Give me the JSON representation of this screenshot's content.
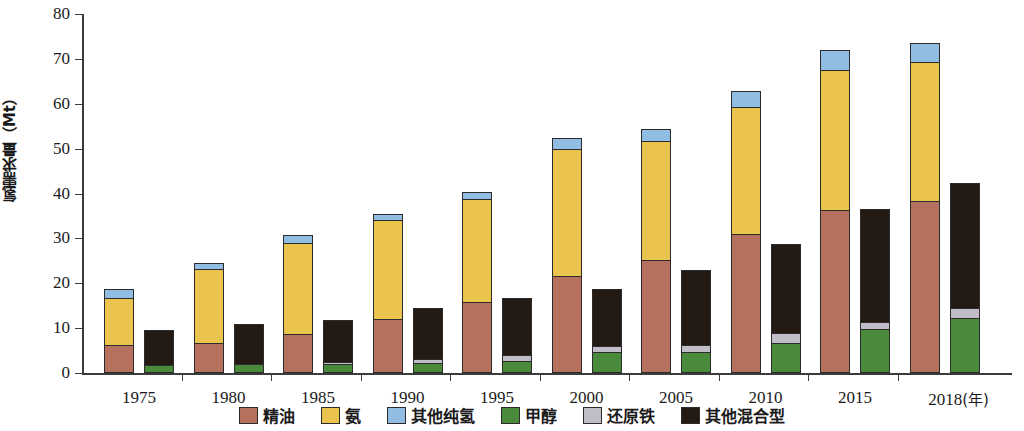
{
  "chart_data": {
    "type": "bar",
    "title": "",
    "xlabel": "年",
    "ylabel": "氢需求量（Mt）",
    "ylim": [
      0,
      80
    ],
    "yticks": [
      0,
      10,
      20,
      30,
      40,
      50,
      60,
      70,
      80
    ],
    "grid": false,
    "legend_position": "bottom",
    "stacked": true,
    "grouped_bars_per_category": 2,
    "categories": [
      "1975",
      "1980",
      "1985",
      "1990",
      "1995",
      "2000",
      "2005",
      "2010",
      "2015",
      "2018"
    ],
    "x_axis_unit_label": "(年)",
    "series": [
      {
        "name": "精油",
        "group": "纯氢",
        "color": "#b5705e",
        "values": [
          6.0,
          6.5,
          8.4,
          11.8,
          15.7,
          21.5,
          25.0,
          30.7,
          36.0,
          38.2
        ]
      },
      {
        "name": "氨",
        "group": "纯氢",
        "color": "#eac44c",
        "values": [
          10.6,
          16.4,
          20.4,
          22.0,
          22.8,
          28.3,
          26.5,
          28.3,
          31.2,
          30.8
        ]
      },
      {
        "name": "其他纯氢",
        "group": "纯氢",
        "color": "#91bde2",
        "values": [
          1.6,
          1.1,
          1.6,
          1.2,
          1.3,
          2.2,
          2.5,
          3.5,
          4.3,
          4.0
        ]
      },
      {
        "name": "甲醇",
        "group": "混合型",
        "color": "#4a8a3c",
        "values": [
          1.5,
          1.8,
          1.8,
          2.0,
          2.5,
          4.4,
          4.4,
          6.5,
          9.5,
          12.0
        ]
      },
      {
        "name": "还原铁",
        "group": "混合型",
        "color": "#c0bcc8",
        "values": [
          0.0,
          0.0,
          0.5,
          0.9,
          1.3,
          1.4,
          1.7,
          2.2,
          1.7,
          2.2
        ]
      },
      {
        "name": "其他混合型",
        "group": "混合型",
        "color": "#231a14",
        "values": [
          7.6,
          8.7,
          9.0,
          11.1,
          12.5,
          12.4,
          16.4,
          19.6,
          24.8,
          27.8
        ]
      }
    ],
    "totals_pure": [
      18.2,
      24.0,
      30.4,
      35.0,
      39.8,
      52.0,
      54.0,
      62.5,
      71.5,
      73.0
    ],
    "totals_mixed": [
      9.1,
      10.5,
      11.3,
      14.0,
      16.3,
      18.2,
      22.5,
      28.3,
      36.0,
      42.0
    ]
  },
  "axis": {
    "y_title": "氢需求量（Mt）",
    "y_tick_labels": [
      "0",
      "10",
      "20",
      "30",
      "40",
      "50",
      "60",
      "70",
      "80"
    ],
    "x_tick_labels": [
      "1975",
      "1980",
      "1985",
      "1990",
      "1995",
      "2000",
      "2005",
      "2010",
      "2015",
      "2018"
    ],
    "x_unit": "(年)"
  },
  "legend": {
    "items": [
      {
        "label": "精油",
        "color": "#b5705e"
      },
      {
        "label": "氨",
        "color": "#eac44c"
      },
      {
        "label": "其他纯氢",
        "color": "#91bde2"
      },
      {
        "label": "甲醇",
        "color": "#4a8a3c"
      },
      {
        "label": "还原铁",
        "color": "#c0bcc8"
      },
      {
        "label": "其他混合型",
        "color": "#231a14"
      }
    ]
  }
}
